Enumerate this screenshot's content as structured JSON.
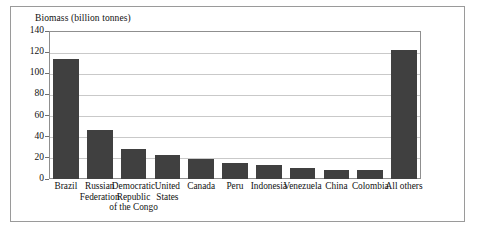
{
  "chart_data": {
    "type": "bar",
    "title": "Biomass (billion tonnes)",
    "xlabel": "",
    "ylabel": "",
    "ylim": [
      0,
      140
    ],
    "ytick_step": 20,
    "yticks": [
      0,
      20,
      40,
      60,
      80,
      100,
      120,
      140
    ],
    "grid": "horizontal",
    "legend": "none",
    "bar_color": "#404040",
    "categories": [
      "Brazil",
      "Russian\nFederation",
      "Democratic\nRepublic\nof the Congo",
      "United\nStates",
      "Canada",
      "Peru",
      "Indonesia",
      "Venezuela",
      "China",
      "Colombia",
      "All others"
    ],
    "values": [
      114,
      46,
      28,
      23,
      19,
      15,
      13,
      10,
      9,
      9,
      122
    ],
    "units": "billion tonnes"
  }
}
